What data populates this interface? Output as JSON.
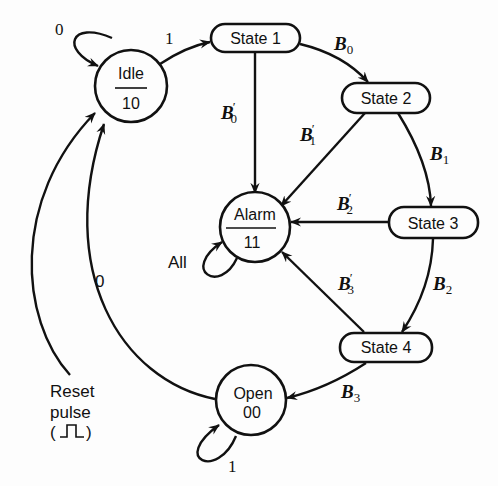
{
  "diagram": {
    "type": "state-machine",
    "nodes": {
      "idle": {
        "name": "Idle",
        "output": "10"
      },
      "state1": {
        "name": "State 1"
      },
      "state2": {
        "name": "State 2"
      },
      "state3": {
        "name": "State 3"
      },
      "state4": {
        "name": "State 4"
      },
      "alarm": {
        "name": "Alarm",
        "output": "11"
      },
      "open": {
        "name": "Open",
        "output": "00"
      }
    },
    "edges": {
      "idle_self": {
        "from": "Idle",
        "to": "Idle",
        "label": "0"
      },
      "idle_state1": {
        "from": "Idle",
        "to": "State 1",
        "label": "1"
      },
      "state1_state2": {
        "from": "State 1",
        "to": "State 2",
        "label_base": "B",
        "label_sub": "0",
        "label_prime": ""
      },
      "state1_alarm": {
        "from": "State 1",
        "to": "Alarm",
        "label_base": "B",
        "label_sub": "0",
        "label_prime": "′"
      },
      "state2_state3": {
        "from": "State 2",
        "to": "State 3",
        "label_base": "B",
        "label_sub": "1",
        "label_prime": ""
      },
      "state2_alarm": {
        "from": "State 2",
        "to": "Alarm",
        "label_base": "B",
        "label_sub": "1",
        "label_prime": "′"
      },
      "state3_state4": {
        "from": "State 3",
        "to": "State 4",
        "label_base": "B",
        "label_sub": "2",
        "label_prime": ""
      },
      "state3_alarm": {
        "from": "State 3",
        "to": "Alarm",
        "label_base": "B",
        "label_sub": "2",
        "label_prime": "′"
      },
      "state4_open": {
        "from": "State 4",
        "to": "Open",
        "label_base": "B",
        "label_sub": "3",
        "label_prime": ""
      },
      "state4_alarm": {
        "from": "State 4",
        "to": "Alarm",
        "label_base": "B",
        "label_sub": "3",
        "label_prime": "′"
      },
      "alarm_self": {
        "from": "Alarm",
        "to": "Alarm",
        "label": "All"
      },
      "open_self": {
        "from": "Open",
        "to": "Open",
        "label": "1"
      },
      "open_idle": {
        "from": "Open",
        "to": "Idle",
        "label": "0"
      },
      "reset_idle": {
        "from": "Reset",
        "to": "Idle",
        "label": ""
      }
    },
    "reset": {
      "line1": "Reset",
      "line2": "pulse",
      "line3_open": "(",
      "line3_close": ")"
    }
  }
}
